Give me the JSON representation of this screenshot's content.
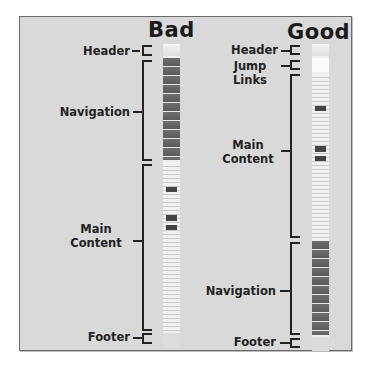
{
  "diagram": {
    "columns": [
      {
        "title": "Bad",
        "sections": [
          {
            "label": "Header",
            "kind": "header"
          },
          {
            "label": "Navigation",
            "kind": "nav"
          },
          {
            "label": "Main Content",
            "label_lines": [
              "Main",
              "Content"
            ],
            "kind": "main"
          },
          {
            "label": "Footer",
            "kind": "footer"
          }
        ]
      },
      {
        "title": "Good",
        "sections": [
          {
            "label": "Header",
            "kind": "header"
          },
          {
            "label": "Jump Links",
            "label_lines": [
              "Jump",
              "Links"
            ],
            "kind": "jump"
          },
          {
            "label": "Main Content",
            "label_lines": [
              "Main",
              "Content"
            ],
            "kind": "main"
          },
          {
            "label": "Navigation",
            "kind": "nav"
          },
          {
            "label": "Footer",
            "kind": "footer"
          }
        ]
      }
    ]
  }
}
